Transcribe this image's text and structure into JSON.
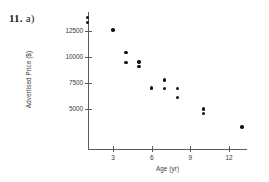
{
  "problem": {
    "number": "11.",
    "part": "a)"
  },
  "chart_data": {
    "type": "scatter",
    "title": "",
    "xlabel": "Age (yr)",
    "ylabel": "Advertised Price ($)",
    "xlim": [
      0,
      14
    ],
    "ylim": [
      2500,
      14500
    ],
    "grid": false,
    "legend": null,
    "xticks": [
      3,
      6,
      9,
      12
    ],
    "xtick_labels": [
      "3",
      "6",
      "9",
      "12"
    ],
    "yticks": [
      5000,
      7500,
      10000,
      12500
    ],
    "ytick_labels": [
      "5000",
      "7500",
      "10000",
      "12500"
    ],
    "x": [
      1,
      1,
      3,
      4,
      4,
      5,
      5,
      6,
      7,
      7,
      8,
      8,
      10,
      10,
      13
    ],
    "y": [
      13800,
      13350,
      12600,
      10400,
      9450,
      9500,
      9050,
      7000,
      7750,
      6950,
      6950,
      6050,
      4950,
      4500,
      3200
    ],
    "points": [
      {
        "x": 1,
        "y": 13800
      },
      {
        "x": 1,
        "y": 13350
      },
      {
        "x": 3,
        "y": 12600
      },
      {
        "x": 4,
        "y": 10400
      },
      {
        "x": 4,
        "y": 9450
      },
      {
        "x": 5,
        "y": 9500
      },
      {
        "x": 5,
        "y": 9050
      },
      {
        "x": 6,
        "y": 7000
      },
      {
        "x": 7,
        "y": 7750
      },
      {
        "x": 7,
        "y": 6950
      },
      {
        "x": 8,
        "y": 6950
      },
      {
        "x": 8,
        "y": 6050
      },
      {
        "x": 10,
        "y": 4950
      },
      {
        "x": 10,
        "y": 4500
      },
      {
        "x": 13,
        "y": 3200
      }
    ],
    "marker": {
      "shape": "circle",
      "color": "#131313",
      "size": 3.4
    },
    "axis_color": "#5b5b5b",
    "text_color": "#3d3d3d",
    "background": "#ffffff"
  }
}
